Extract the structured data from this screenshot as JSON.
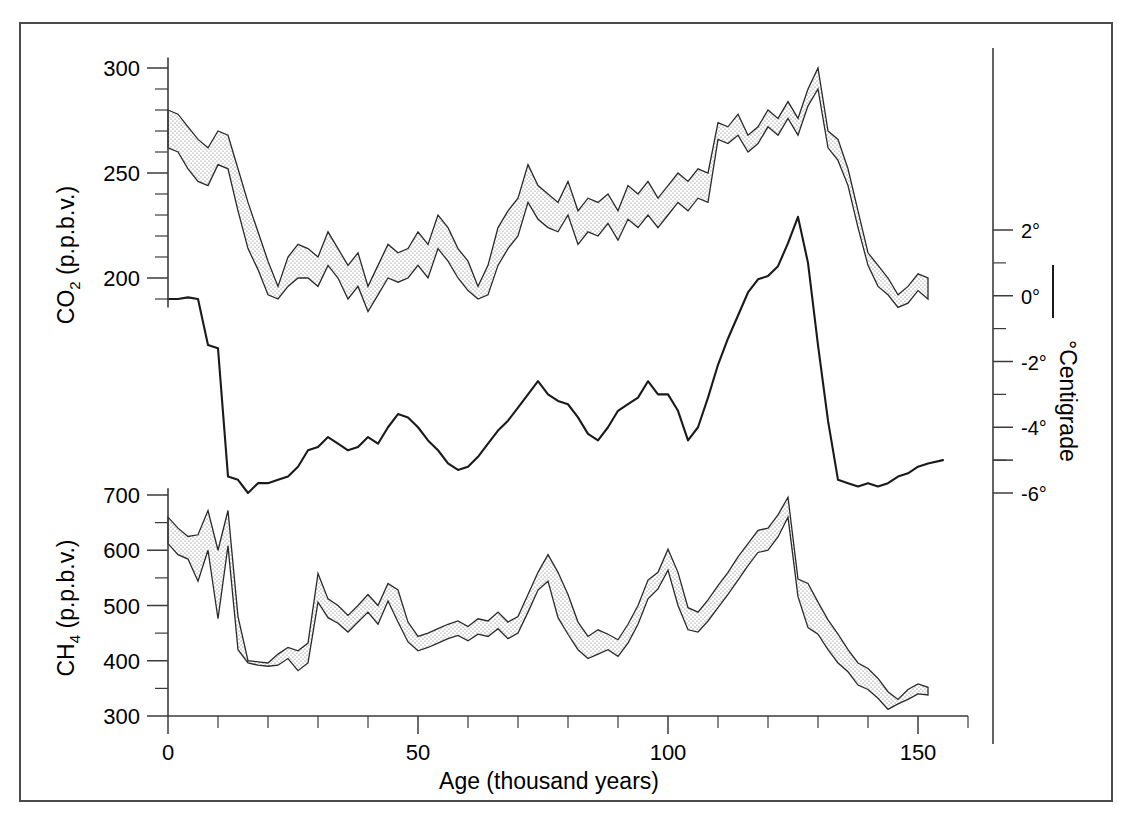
{
  "figure": {
    "background_color": "#ffffff",
    "frame_color": "#4a4a4a",
    "ink_color": "#1a1a1a"
  },
  "axes": {
    "x": {
      "title": "Age (thousand years)",
      "tick_labels": [
        "0",
        "50",
        "100",
        "150"
      ],
      "tick_values": [
        0,
        50,
        100,
        150
      ],
      "minor_step": 10,
      "range": [
        0,
        160
      ]
    },
    "co2": {
      "title_main": "CO",
      "title_sub": "2",
      "title_tail": " (p.p.b.v.)",
      "title_full": "CO2 (p.p.b.v.)",
      "tick_labels": [
        "200",
        "250",
        "300"
      ],
      "tick_values": [
        200,
        250,
        300
      ],
      "minor_step": 10,
      "range": [
        185,
        305
      ]
    },
    "ch4": {
      "title_main": "CH",
      "title_sub": "4",
      "title_tail": " (p.p.b.v.)",
      "title_full": "CH4 (p.p.b.v.)",
      "tick_labels": [
        "300",
        "400",
        "500",
        "600",
        "700"
      ],
      "tick_values": [
        300,
        400,
        500,
        600,
        700
      ],
      "minor_step": 50,
      "range": [
        300,
        710
      ]
    },
    "temperature": {
      "title": "°Centigrade",
      "tick_labels": [
        "2°",
        "0°",
        "-2°",
        "-4°",
        "-6°"
      ],
      "tick_values": [
        2,
        0,
        -2,
        -4,
        -6
      ],
      "minor_step": 1,
      "range": [
        -7,
        3.5
      ],
      "legend_marker": "solid-line"
    }
  },
  "chart_data": {
    "type": "area",
    "title": "",
    "xlabel": "Age (thousand years)",
    "ylabel": "CO2 (p.p.b.v.) / CH4 (p.p.b.v.)",
    "grid": false,
    "legend_position": "right",
    "panels": [
      {
        "name": "co2-band",
        "label": "CO2 (p.p.b.v.)",
        "style": "stippled-band",
        "ylim": [
          185,
          305
        ],
        "x": [
          0,
          2,
          4,
          6,
          8,
          10,
          12,
          14,
          16,
          18,
          20,
          22,
          24,
          26,
          28,
          30,
          32,
          34,
          36,
          38,
          40,
          42,
          44,
          46,
          48,
          50,
          52,
          54,
          56,
          58,
          60,
          62,
          64,
          66,
          68,
          70,
          72,
          74,
          76,
          78,
          80,
          82,
          84,
          86,
          88,
          90,
          92,
          94,
          96,
          98,
          100,
          102,
          104,
          106,
          108,
          110,
          112,
          114,
          116,
          118,
          120,
          122,
          124,
          126,
          128,
          130,
          132,
          134,
          136,
          138,
          140,
          142,
          144,
          146,
          148,
          150,
          152
        ],
        "upper": [
          280,
          278,
          272,
          266,
          262,
          270,
          268,
          252,
          236,
          222,
          208,
          196,
          210,
          216,
          214,
          210,
          222,
          214,
          206,
          212,
          196,
          206,
          216,
          212,
          214,
          222,
          216,
          230,
          224,
          214,
          208,
          196,
          206,
          224,
          232,
          238,
          254,
          244,
          240,
          236,
          246,
          232,
          238,
          236,
          240,
          232,
          244,
          240,
          246,
          238,
          244,
          250,
          246,
          252,
          250,
          274,
          272,
          278,
          268,
          272,
          280,
          276,
          284,
          276,
          290,
          300,
          270,
          266,
          252,
          232,
          212,
          206,
          200,
          192,
          196,
          202,
          200
        ],
        "lower": [
          262,
          260,
          252,
          246,
          244,
          254,
          252,
          232,
          214,
          204,
          192,
          190,
          196,
          200,
          200,
          196,
          206,
          200,
          190,
          196,
          184,
          192,
          200,
          198,
          200,
          206,
          200,
          214,
          208,
          200,
          194,
          190,
          192,
          206,
          214,
          220,
          236,
          228,
          224,
          222,
          230,
          216,
          222,
          220,
          226,
          218,
          228,
          224,
          230,
          224,
          230,
          236,
          232,
          238,
          236,
          266,
          264,
          268,
          260,
          264,
          272,
          268,
          276,
          268,
          282,
          290,
          262,
          256,
          244,
          224,
          206,
          196,
          192,
          186,
          188,
          194,
          190
        ]
      },
      {
        "name": "temperature-curve",
        "label": "°Centigrade",
        "style": "solid-line",
        "ylim": [
          -7,
          3.5
        ],
        "x": [
          0,
          2,
          4,
          6,
          8,
          10,
          12,
          14,
          16,
          18,
          20,
          22,
          24,
          26,
          28,
          30,
          32,
          34,
          36,
          38,
          40,
          42,
          44,
          46,
          48,
          50,
          52,
          54,
          56,
          58,
          60,
          62,
          64,
          66,
          68,
          70,
          72,
          74,
          76,
          78,
          80,
          82,
          84,
          86,
          88,
          90,
          92,
          94,
          96,
          98,
          100,
          102,
          104,
          106,
          108,
          110,
          112,
          114,
          116,
          118,
          120,
          122,
          124,
          126,
          128,
          130,
          132,
          134,
          136,
          138,
          140,
          142,
          144,
          146,
          148,
          150,
          152,
          155
        ],
        "y": [
          -0.1,
          -0.1,
          -0.05,
          -0.1,
          -1.5,
          -1.6,
          -5.5,
          -5.6,
          -6.0,
          -5.7,
          -5.7,
          -5.6,
          -5.5,
          -5.2,
          -4.7,
          -4.6,
          -4.3,
          -4.5,
          -4.7,
          -4.6,
          -4.3,
          -4.5,
          -4.0,
          -3.6,
          -3.7,
          -4.0,
          -4.4,
          -4.7,
          -5.1,
          -5.3,
          -5.2,
          -4.9,
          -4.5,
          -4.1,
          -3.8,
          -3.4,
          -3.0,
          -2.6,
          -3.0,
          -3.2,
          -3.3,
          -3.7,
          -4.2,
          -4.4,
          -4.0,
          -3.5,
          -3.3,
          -3.1,
          -2.6,
          -3.0,
          -3.0,
          -3.5,
          -4.4,
          -4.0,
          -3.1,
          -2.1,
          -1.3,
          -0.6,
          0.1,
          0.5,
          0.6,
          0.9,
          1.6,
          2.4,
          1.0,
          -1.5,
          -3.8,
          -5.6,
          -5.7,
          -5.8,
          -5.7,
          -5.8,
          -5.7,
          -5.5,
          -5.4,
          -5.2,
          -5.1,
          -5.0
        ]
      },
      {
        "name": "ch4-band",
        "label": "CH4 (p.p.b.v.)",
        "style": "stippled-band",
        "ylim": [
          300,
          710
        ],
        "x": [
          0,
          2,
          4,
          6,
          8,
          10,
          12,
          14,
          16,
          18,
          20,
          22,
          24,
          26,
          28,
          30,
          32,
          34,
          36,
          38,
          40,
          42,
          44,
          46,
          48,
          50,
          52,
          54,
          56,
          58,
          60,
          62,
          64,
          66,
          68,
          70,
          72,
          74,
          76,
          78,
          80,
          82,
          84,
          86,
          88,
          90,
          92,
          94,
          96,
          98,
          100,
          102,
          104,
          106,
          108,
          110,
          112,
          114,
          116,
          118,
          120,
          122,
          124,
          126,
          128,
          130,
          132,
          134,
          136,
          138,
          140,
          142,
          144,
          146,
          148,
          150,
          152
        ],
        "upper": [
          660,
          640,
          625,
          628,
          672,
          600,
          672,
          480,
          400,
          398,
          396,
          412,
          424,
          418,
          432,
          558,
          512,
          500,
          482,
          500,
          520,
          500,
          540,
          528,
          470,
          444,
          450,
          458,
          466,
          472,
          462,
          476,
          472,
          488,
          470,
          480,
          520,
          560,
          592,
          560,
          520,
          470,
          444,
          456,
          448,
          438,
          466,
          500,
          546,
          560,
          602,
          560,
          496,
          488,
          510,
          536,
          560,
          588,
          612,
          636,
          640,
          664,
          696,
          548,
          540,
          506,
          474,
          448,
          420,
          396,
          386,
          368,
          344,
          330,
          348,
          358,
          352
        ],
        "lower": [
          612,
          592,
          584,
          544,
          600,
          476,
          608,
          420,
          396,
          392,
          390,
          392,
          404,
          382,
          396,
          506,
          478,
          468,
          452,
          470,
          488,
          466,
          508,
          470,
          434,
          418,
          424,
          432,
          440,
          446,
          436,
          448,
          444,
          458,
          440,
          450,
          488,
          528,
          544,
          478,
          448,
          420,
          404,
          412,
          420,
          408,
          432,
          466,
          512,
          530,
          564,
          500,
          456,
          452,
          472,
          496,
          520,
          546,
          572,
          596,
          600,
          624,
          660,
          516,
          460,
          448,
          420,
          396,
          380,
          356,
          348,
          332,
          312,
          322,
          330,
          340,
          338
        ]
      }
    ]
  }
}
